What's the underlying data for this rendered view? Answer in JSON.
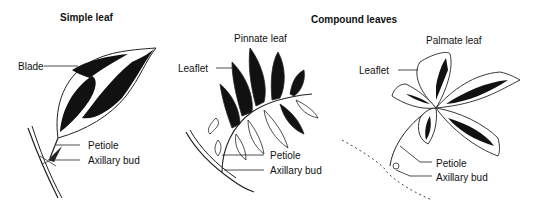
{
  "titles": {
    "simple": "Simple leaf",
    "compound": "Compound leaves"
  },
  "panels": {
    "simple": {
      "labels": {
        "blade": "Blade",
        "petiole": "Petiole",
        "bud": "Axillary bud"
      }
    },
    "pinnate": {
      "title": "Pinnate leaf",
      "labels": {
        "leaflet": "Leaflet",
        "petiole": "Petiole",
        "bud": "Axillary bud"
      }
    },
    "palmate": {
      "title": "Palmate leaf",
      "labels": {
        "leaflet": "Leaflet",
        "petiole": "Petiole",
        "bud": "Axillary bud"
      }
    }
  },
  "colors": {
    "ink": "#111111",
    "background": "#ffffff"
  }
}
